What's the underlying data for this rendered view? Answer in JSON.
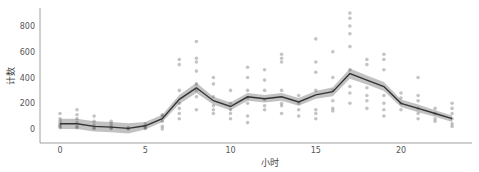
{
  "chart_data": {
    "type": "line",
    "title": "",
    "xlabel": "小时",
    "ylabel": "计数",
    "x": [
      0,
      1,
      2,
      3,
      4,
      5,
      6,
      7,
      8,
      9,
      10,
      11,
      12,
      13,
      14,
      15,
      16,
      17,
      18,
      19,
      20,
      21,
      22,
      23
    ],
    "series": [
      {
        "name": "mean count",
        "values": [
          40,
          40,
          20,
          15,
          5,
          25,
          80,
          230,
          320,
          220,
          175,
          250,
          235,
          250,
          210,
          265,
          290,
          430,
          380,
          330,
          200,
          160,
          120,
          80
        ],
        "ci_lower": [
          0,
          0,
          -20,
          -25,
          -35,
          -5,
          55,
          195,
          280,
          190,
          145,
          220,
          205,
          220,
          180,
          235,
          255,
          390,
          345,
          295,
          170,
          130,
          95,
          55
        ],
        "ci_upper": [
          80,
          80,
          60,
          55,
          45,
          55,
          110,
          265,
          360,
          250,
          205,
          280,
          265,
          280,
          240,
          295,
          325,
          470,
          415,
          365,
          230,
          190,
          145,
          105
        ],
        "color": "#333333",
        "band_color": "#999999"
      }
    ],
    "scatter_points": [
      [
        0,
        20
      ],
      [
        0,
        40
      ],
      [
        0,
        60
      ],
      [
        0,
        80
      ],
      [
        0,
        120
      ],
      [
        0,
        10
      ],
      [
        0,
        30
      ],
      [
        1,
        20
      ],
      [
        1,
        50
      ],
      [
        1,
        80
      ],
      [
        1,
        110
      ],
      [
        1,
        150
      ],
      [
        1,
        10
      ],
      [
        2,
        10
      ],
      [
        2,
        30
      ],
      [
        2,
        60
      ],
      [
        2,
        100
      ],
      [
        2,
        5
      ],
      [
        3,
        5
      ],
      [
        3,
        20
      ],
      [
        3,
        40
      ],
      [
        3,
        60
      ],
      [
        3,
        10
      ],
      [
        4,
        0
      ],
      [
        4,
        5
      ],
      [
        4,
        10
      ],
      [
        5,
        10
      ],
      [
        5,
        20
      ],
      [
        5,
        40
      ],
      [
        5,
        5
      ],
      [
        6,
        20
      ],
      [
        6,
        60
      ],
      [
        6,
        100
      ],
      [
        6,
        110
      ],
      [
        6,
        0
      ],
      [
        7,
        120
      ],
      [
        7,
        160
      ],
      [
        7,
        200
      ],
      [
        7,
        300
      ],
      [
        7,
        500
      ],
      [
        7,
        540
      ],
      [
        7,
        80
      ],
      [
        8,
        150
      ],
      [
        8,
        250
      ],
      [
        8,
        350
      ],
      [
        8,
        450
      ],
      [
        8,
        520
      ],
      [
        8,
        550
      ],
      [
        8,
        680
      ],
      [
        8,
        300
      ],
      [
        9,
        120
      ],
      [
        9,
        180
      ],
      [
        9,
        250
      ],
      [
        9,
        350
      ],
      [
        9,
        400
      ],
      [
        9,
        150
      ],
      [
        10,
        80
      ],
      [
        10,
        150
      ],
      [
        10,
        200
      ],
      [
        10,
        300
      ],
      [
        10,
        120
      ],
      [
        11,
        100
      ],
      [
        11,
        200
      ],
      [
        11,
        300
      ],
      [
        11,
        400
      ],
      [
        11,
        480
      ],
      [
        11,
        50
      ],
      [
        11,
        240
      ],
      [
        12,
        150
      ],
      [
        12,
        230
      ],
      [
        12,
        300
      ],
      [
        12,
        380
      ],
      [
        12,
        460
      ],
      [
        12,
        180
      ],
      [
        13,
        120
      ],
      [
        13,
        200
      ],
      [
        13,
        300
      ],
      [
        13,
        550
      ],
      [
        13,
        580
      ],
      [
        13,
        520
      ],
      [
        13,
        180
      ],
      [
        14,
        150
      ],
      [
        14,
        200
      ],
      [
        14,
        260
      ],
      [
        14,
        100
      ],
      [
        15,
        80
      ],
      [
        15,
        150
      ],
      [
        15,
        300
      ],
      [
        15,
        520
      ],
      [
        15,
        440
      ],
      [
        15,
        700
      ],
      [
        15,
        120
      ],
      [
        16,
        160
      ],
      [
        16,
        220
      ],
      [
        16,
        300
      ],
      [
        16,
        400
      ],
      [
        16,
        600
      ],
      [
        16,
        140
      ],
      [
        17,
        200
      ],
      [
        17,
        280
      ],
      [
        17,
        330
      ],
      [
        17,
        460
      ],
      [
        17,
        740
      ],
      [
        17,
        800
      ],
      [
        17,
        860
      ],
      [
        17,
        900
      ],
      [
        17,
        640
      ],
      [
        18,
        160
      ],
      [
        18,
        220
      ],
      [
        18,
        320
      ],
      [
        18,
        500
      ],
      [
        18,
        540
      ],
      [
        18,
        260
      ],
      [
        19,
        100
      ],
      [
        19,
        150
      ],
      [
        19,
        260
      ],
      [
        19,
        460
      ],
      [
        19,
        540
      ],
      [
        19,
        580
      ],
      [
        19,
        200
      ],
      [
        20,
        150
      ],
      [
        20,
        200
      ],
      [
        20,
        280
      ],
      [
        20,
        240
      ],
      [
        21,
        80
      ],
      [
        21,
        120
      ],
      [
        21,
        160
      ],
      [
        21,
        220
      ],
      [
        21,
        400
      ],
      [
        21,
        260
      ],
      [
        22,
        80
      ],
      [
        22,
        120
      ],
      [
        22,
        160
      ],
      [
        22,
        60
      ],
      [
        23,
        20
      ],
      [
        23,
        40
      ],
      [
        23,
        80
      ],
      [
        23,
        120
      ],
      [
        23,
        160
      ],
      [
        23,
        200
      ]
    ],
    "x_ticks": [
      0,
      5,
      10,
      15,
      20
    ],
    "y_ticks": [
      0,
      200,
      400,
      600,
      800
    ],
    "xlim": [
      -0.8,
      24.2
    ],
    "ylim": [
      -90,
      960
    ],
    "grid": false,
    "legend": null
  }
}
